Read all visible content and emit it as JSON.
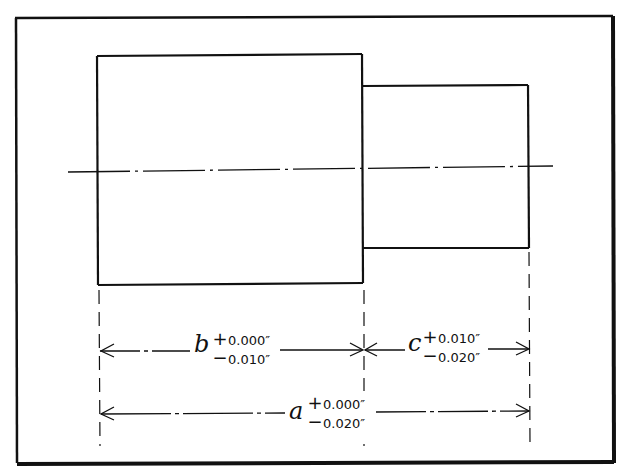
{
  "figure": {
    "type": "stepped-shaft-dimensioning-drawing",
    "stroke_color": "#111111",
    "background": "#ffffff"
  },
  "dimensions": {
    "b": {
      "variable": "b",
      "plus_sign": "+",
      "plus_value": "0.000″",
      "minus_sign": "−",
      "minus_value": "0.010″"
    },
    "c": {
      "variable": "c",
      "plus_sign": "+",
      "plus_value": "0.010″",
      "minus_sign": "−",
      "minus_value": "0.020″"
    },
    "a": {
      "variable": "a",
      "plus_sign": "+",
      "plus_value": "0.000″",
      "minus_sign": "−",
      "minus_value": "0.020″"
    }
  }
}
